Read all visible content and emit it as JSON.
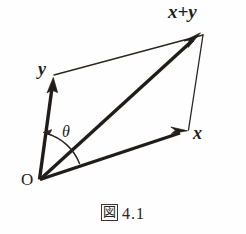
{
  "figure": {
    "caption_symbol": "図",
    "caption_number": "4.1",
    "caption_full": "図 4.1",
    "background_color": "#fefefe",
    "ink_color": "#211d1a",
    "labels": {
      "sum_vector": "x+y",
      "vector_y": "y",
      "vector_x": "x",
      "angle": "θ",
      "origin": "O"
    },
    "geometry": {
      "origin": [
        39,
        180
      ],
      "tip_x": [
        186,
        131
      ],
      "tip_y": [
        53,
        78
      ],
      "tip_sum": [
        200,
        33
      ],
      "corner_upper_right": [
        203,
        35
      ],
      "thin_side_from_y_tip_to_corner": [
        [
          54,
          74
        ],
        [
          203,
          35
        ]
      ],
      "thin_side_from_corner_to_x_tip": [
        [
          203,
          35
        ],
        [
          188,
          130
        ]
      ],
      "angle_arc_start": [
        78,
        162
      ],
      "angle_arc_end": [
        44,
        133
      ],
      "angle_arc_radius": 48
    }
  }
}
